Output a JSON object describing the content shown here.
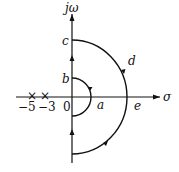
{
  "diagram": {
    "type": "nyquist-contour",
    "axes": {
      "vertical_label": "jω",
      "horizontal_label": "σ"
    },
    "points": {
      "a": "a",
      "b": "b",
      "c": "c",
      "d": "d",
      "e": "e",
      "origin": "0"
    },
    "poles": [
      {
        "label": "−5",
        "value": -5
      },
      {
        "label": "−3",
        "value": -3
      }
    ],
    "colors": {
      "stroke": "#111111",
      "background": "#ffffff"
    }
  }
}
